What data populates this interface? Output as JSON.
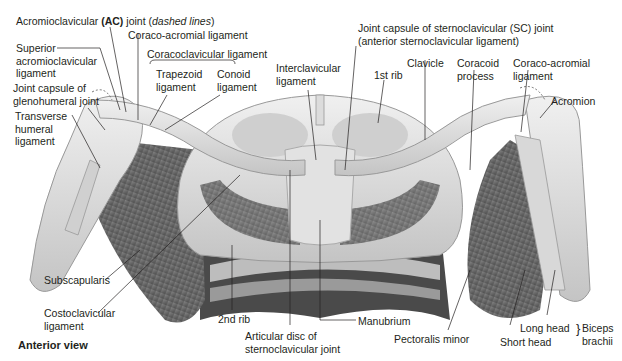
{
  "figure": {
    "view_label": "Anterior view",
    "colors": {
      "background": "#ffffff",
      "bone_light": "#e6e6e6",
      "bone_mid": "#cfcfcf",
      "bone_shadow": "#a8a8a8",
      "muscle_dark": "#5e5e5e",
      "muscle_mid": "#7c7c7c",
      "cartilage_dark": "#3c3c3c",
      "leader_line": "#231f20",
      "text": "#231f20"
    }
  },
  "labels": {
    "ac_joint_pre": "Acromioclavicular ",
    "ac_joint_bold": "(AC)",
    "ac_joint_post": " joint (",
    "ac_joint_italic": "dashed lines",
    "ac_joint_end": ")",
    "coraco_acromial_left": "Coraco-acromial ligament",
    "superior_ac_ligament": "Superior\nacromioclavicular\nligament",
    "coracoclavicular_ligament": "Coracoclavicular ligament",
    "trapezoid_ligament": "Trapezoid\nligament",
    "conoid_ligament": "Conoid\nligament",
    "joint_capsule_glenohumeral": "Joint capsule of\nglenohumeral joint",
    "transverse_humeral_ligament": "Transverse\nhumeral\nligament",
    "interclavicular_ligament": "Interclavicular\nligament",
    "sc_joint_capsule": "Joint capsule of sternoclavicular (SC) joint\n(anterior sternoclavicular ligament)",
    "first_rib": "1st rib",
    "clavicle": "Clavicle",
    "coracoid_process": "Coracoid\nprocess",
    "coraco_acromial_right": "Coraco-acromial\nligament",
    "acromion": "Acromion",
    "subscapularis": "Subscapularis",
    "costoclavicular_ligament": "Costoclavicular\nligament",
    "second_rib": "2nd rib",
    "articular_disc": "Articular disc of\nsternoclavicular joint",
    "manubrium": "Manubrium",
    "pectoralis_minor": "Pectoralis minor",
    "long_head": "Long head",
    "short_head": "Short head",
    "biceps_brachii": "Biceps\nbrachii"
  }
}
